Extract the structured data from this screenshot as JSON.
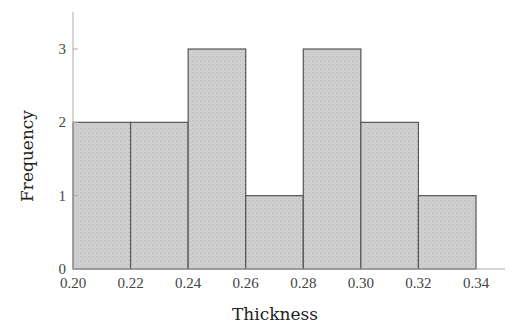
{
  "chart_data": {
    "type": "bar",
    "subtype": "histogram",
    "title": "",
    "xlabel": "Thickness",
    "ylabel": "Frequency",
    "bins": [
      {
        "start": 0.2,
        "end": 0.22,
        "count": 2
      },
      {
        "start": 0.22,
        "end": 0.24,
        "count": 2
      },
      {
        "start": 0.24,
        "end": 0.26,
        "count": 3
      },
      {
        "start": 0.26,
        "end": 0.28,
        "count": 1
      },
      {
        "start": 0.28,
        "end": 0.3,
        "count": 3
      },
      {
        "start": 0.3,
        "end": 0.32,
        "count": 2
      },
      {
        "start": 0.32,
        "end": 0.34,
        "count": 1
      }
    ],
    "categories": [
      "0.20-0.22",
      "0.22-0.24",
      "0.24-0.26",
      "0.26-0.28",
      "0.28-0.30",
      "0.30-0.32",
      "0.32-0.34"
    ],
    "values": [
      2,
      2,
      3,
      1,
      3,
      2,
      1
    ],
    "xticks": [
      "0.20",
      "0.22",
      "0.24",
      "0.26",
      "0.28",
      "0.30",
      "0.32",
      "0.34"
    ],
    "yticks": [
      "0",
      "1",
      "2",
      "3"
    ],
    "xlim": [
      0.2,
      0.36
    ],
    "ylim": [
      0,
      3.5
    ],
    "grid": false,
    "legend": null,
    "colors": {
      "bar_fill": "#cdcdcd",
      "bar_edge": "#555555",
      "axis": "#aaaaaa"
    }
  }
}
